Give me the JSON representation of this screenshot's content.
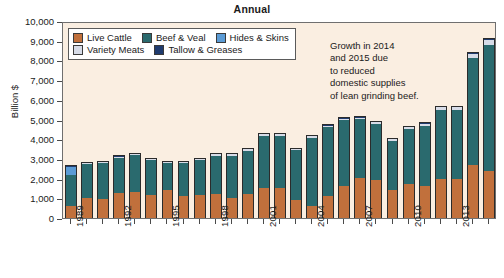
{
  "chart_data": {
    "type": "bar",
    "subtype": "stacked-bar",
    "title": "Annual",
    "xlabel": "",
    "ylabel": "Billion $",
    "ylim": [
      0,
      10000
    ],
    "ytick_step": 1000,
    "grid": false,
    "legend_position": "top-left-inside",
    "categories": [
      "1989",
      "1990",
      "1991",
      "1992",
      "1993",
      "1994",
      "1995",
      "1996",
      "1997",
      "1998",
      "1999",
      "2000",
      "2001",
      "2002",
      "2003",
      "2004",
      "2005",
      "2006",
      "2007",
      "2008",
      "2009",
      "2010",
      "2011",
      "2012",
      "2013",
      "2014",
      "2015"
    ],
    "xtick_labels": [
      "1989",
      "1992",
      "1995",
      "1998",
      "2001",
      "2004",
      "2007",
      "2010",
      "2013"
    ],
    "ytick_labels": [
      "0",
      "1,000",
      "2,000",
      "3,000",
      "4,000",
      "5,000",
      "6,000",
      "7,000",
      "8,000",
      "9,000",
      "10,000"
    ],
    "series": [
      {
        "name": "Live Cattle",
        "color": "#c1703c",
        "values": [
          620,
          1000,
          950,
          1250,
          1340,
          1170,
          1430,
          1120,
          1170,
          1210,
          1040,
          1220,
          1530,
          1540,
          930,
          620,
          1110,
          1650,
          2010,
          1930,
          1440,
          1710,
          1600,
          1960,
          1960,
          2670,
          2400
        ]
      },
      {
        "name": "Beef & Veal",
        "color": "#2a6a6e",
        "values": [
          1560,
          1740,
          1850,
          1790,
          1840,
          1760,
          1370,
          1650,
          1760,
          1940,
          2110,
          2190,
          2640,
          2640,
          2510,
          3450,
          3520,
          3310,
          3000,
          2840,
          2490,
          2820,
          3090,
          3520,
          3510,
          5430,
          6400
        ]
      },
      {
        "name": "Hides & Skins",
        "color": "#5b9bd5",
        "values": [
          420,
          0,
          0,
          0,
          0,
          0,
          0,
          0,
          0,
          0,
          0,
          0,
          0,
          0,
          0,
          0,
          0,
          0,
          0,
          0,
          0,
          0,
          0,
          0,
          0,
          0,
          0
        ]
      },
      {
        "name": "Variety Meats",
        "color": "#d7dce8",
        "values": [
          0,
          40,
          50,
          80,
          70,
          40,
          40,
          50,
          70,
          80,
          90,
          90,
          90,
          70,
          70,
          70,
          60,
          90,
          90,
          80,
          80,
          90,
          100,
          150,
          160,
          230,
          250
        ]
      },
      {
        "name": "Tallow & Greases",
        "color": "#1f3b6e",
        "values": [
          80,
          40,
          50,
          60,
          50,
          40,
          40,
          50,
          60,
          60,
          60,
          60,
          60,
          60,
          60,
          60,
          60,
          60,
          60,
          60,
          60,
          60,
          60,
          60,
          60,
          80,
          80
        ]
      }
    ],
    "totals": [
      2680,
      2820,
      2900,
      3180,
      3300,
      3010,
      2880,
      2870,
      3060,
      3290,
      3300,
      3560,
      4320,
      4310,
      3570,
      4200,
      4750,
      5110,
      5160,
      4910,
      4070,
      4680,
      4850,
      5690,
      5690,
      8410,
      9130
    ],
    "annotation": {
      "lines": [
        "Growth in 2014",
        "and 2015 due",
        "to reduced",
        "domestic supplies",
        "of lean grinding beef."
      ]
    },
    "colors": {
      "plot_background": "#faeee1",
      "page_background": "#ffffff",
      "axis": "#4a4a4a",
      "bar_outline": "#2b2b2b"
    }
  }
}
